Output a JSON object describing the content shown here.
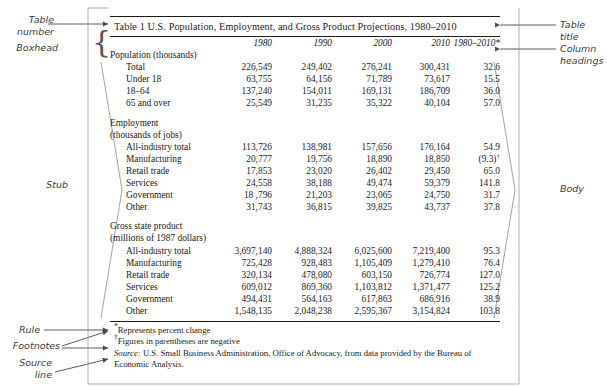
{
  "table": {
    "title": "Table 1  U.S. Population, Employment, and Gross Product Projections, 1980–2010",
    "column_headings": [
      "",
      "1980",
      "1990",
      "2000",
      "2010",
      "1980–2010*"
    ],
    "sections": [
      {
        "heading": "Population (thousands)",
        "rows": [
          {
            "label": "Total",
            "values": [
              "226,549",
              "249,402",
              "276,241",
              "300,431",
              "32.6"
            ]
          },
          {
            "label": "Under 18",
            "values": [
              "63,755",
              "64,156",
              "71,789",
              "73,617",
              "15.5"
            ]
          },
          {
            "label": "18–64",
            "values": [
              "137,240",
              "154,011",
              "169,131",
              "186,709",
              "36.0"
            ]
          },
          {
            "label": "65 and over",
            "values": [
              "25,549",
              "31,235",
              "35,322",
              "40,104",
              "57.0"
            ]
          }
        ]
      },
      {
        "heading": "Employment",
        "heading2": "(thousands of jobs)",
        "rows": [
          {
            "label": "All-industry total",
            "values": [
              "113,726",
              "138,981",
              "157,656",
              "176,164",
              "54.9"
            ]
          },
          {
            "label": "Manufacturing",
            "values": [
              "20,777",
              "19,756",
              "18,890",
              "18,850",
              "(9.3)"
            ],
            "last_footnote": "†"
          },
          {
            "label": "Retail trade",
            "values": [
              "17,853",
              "23,020",
              "26,402",
              "29,450",
              "65.0"
            ]
          },
          {
            "label": "Services",
            "values": [
              "24,558",
              "38,188",
              "49,474",
              "59,379",
              "141.8"
            ]
          },
          {
            "label": "Government",
            "values": [
              "18 ,796",
              "21,203",
              "23,065",
              "24,750",
              "31.7"
            ]
          },
          {
            "label": "Other",
            "values": [
              "31,743",
              "36,815",
              "39,825",
              "43,737",
              "37.8"
            ]
          }
        ]
      },
      {
        "heading": "Gross state product",
        "heading2": "(millions of 1987 dollars)",
        "rows": [
          {
            "label": "All-industry total",
            "values": [
              "3,697,140",
              "4,888,324",
              "6,025,600",
              "7,219,400",
              "95.3"
            ]
          },
          {
            "label": "Manufacturing",
            "values": [
              "725,428",
              "928,483",
              "1,105,409",
              "1,279,410",
              "76.4"
            ]
          },
          {
            "label": "Retail trade",
            "values": [
              "320,134",
              "478,080",
              "603,150",
              "726,774",
              "127.0"
            ]
          },
          {
            "label": "Services",
            "values": [
              "609,012",
              "869,360",
              "1,103,812",
              "1,371,477",
              "125.2"
            ]
          },
          {
            "label": "Government",
            "values": [
              "494,431",
              "564,163",
              "617,863",
              "686,916",
              "38.9"
            ]
          },
          {
            "label": "Other",
            "values": [
              "1,548,135",
              "2,048,238",
              "2,595,367",
              "3,154,824",
              "103.8"
            ]
          }
        ]
      }
    ],
    "footnotes": [
      {
        "mark": "*",
        "text": "Represents percent change"
      },
      {
        "mark": "†",
        "text": "Figures in parentheses are negative"
      }
    ],
    "source": {
      "label": "Source:",
      "text": " U.S. Small Business Administration, Office of Advocacy, from data provided by the Bureau of Economic Analysis."
    }
  },
  "annotations": {
    "left": [
      {
        "id": "table-number",
        "text": "Table\nnumber"
      },
      {
        "id": "boxhead",
        "text": "Boxhead"
      },
      {
        "id": "stub",
        "text": "Stub"
      },
      {
        "id": "rule",
        "text": "Rule"
      },
      {
        "id": "footnotes",
        "text": "Footnotes"
      },
      {
        "id": "source-line",
        "text": "Source\nline"
      }
    ],
    "right": [
      {
        "id": "table-title",
        "text": "Table title"
      },
      {
        "id": "column-headings",
        "text": "Column\nheadings"
      },
      {
        "id": "body",
        "text": "Body"
      }
    ]
  },
  "colors": {
    "ink": "#1a1a1a",
    "annotation": "#3a3a3a",
    "brace": "#555555"
  }
}
